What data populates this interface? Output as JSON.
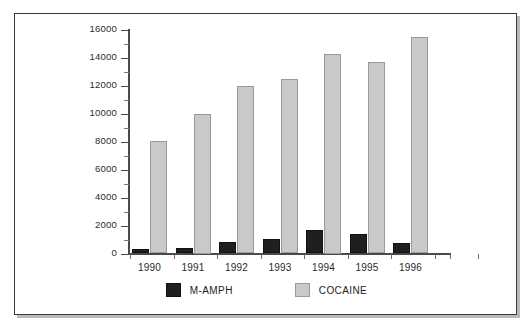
{
  "figure": {
    "border_color": "#3a3a3a",
    "background": "#ffffff"
  },
  "chart_data": {
    "type": "bar",
    "title": "",
    "subtitle": "",
    "xlabel": "",
    "ylabel": "",
    "categories": [
      "1990",
      "1991",
      "1992",
      "1993",
      "1994",
      "1995",
      "1996"
    ],
    "series": [
      {
        "name": "M-AMPH",
        "color": "#1f1f1f",
        "values": [
          350,
          380,
          820,
          1050,
          1650,
          1400,
          720
        ]
      },
      {
        "name": "COCAINE",
        "color": "#c9c9c9",
        "values": [
          8050,
          10000,
          11950,
          12450,
          14250,
          13700,
          15450
        ]
      }
    ],
    "ylim": [
      0,
      16000
    ],
    "ytick_labels": [
      "0",
      "2000",
      "4000",
      "6000",
      "8000",
      "10000",
      "12000",
      "14000",
      "16000"
    ],
    "ytick_values": [
      0,
      2000,
      4000,
      6000,
      8000,
      10000,
      12000,
      14000,
      16000
    ],
    "yminor_step": 1000,
    "grid": false,
    "legend_position": "bottom-center"
  },
  "legend": {
    "items": [
      {
        "label": "M-AMPH",
        "color": "#1f1f1f"
      },
      {
        "label": "COCAINE",
        "color": "#c9c9c9"
      }
    ]
  }
}
